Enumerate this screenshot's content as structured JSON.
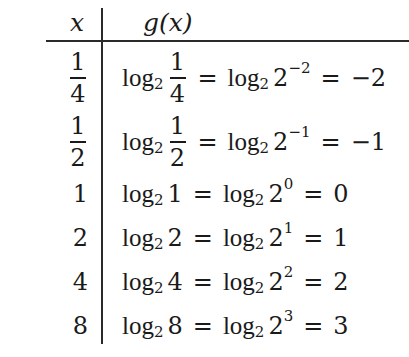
{
  "table": {
    "headers": {
      "x": "x",
      "g": "g(x)"
    },
    "rows": [
      {
        "x_num": "1",
        "x_den": "4",
        "x": "1/4",
        "arg_num": "1",
        "arg_den": "4",
        "base": "2",
        "exp": "−2",
        "result": "−2",
        "log": "log",
        "sub": "2",
        "eq": "="
      },
      {
        "x_num": "1",
        "x_den": "2",
        "x": "1/2",
        "arg_num": "1",
        "arg_den": "2",
        "base": "2",
        "exp": "−1",
        "result": "−1",
        "log": "log",
        "sub": "2",
        "eq": "="
      },
      {
        "x": "1",
        "arg": "1",
        "base": "2",
        "exp": "0",
        "result": "0",
        "log": "log",
        "sub": "2",
        "eq": "="
      },
      {
        "x": "2",
        "arg": "2",
        "base": "2",
        "exp": "1",
        "result": "1",
        "log": "log",
        "sub": "2",
        "eq": "="
      },
      {
        "x": "4",
        "arg": "4",
        "base": "2",
        "exp": "2",
        "result": "2",
        "log": "log",
        "sub": "2",
        "eq": "="
      },
      {
        "x": "8",
        "arg": "8",
        "base": "2",
        "exp": "3",
        "result": "3",
        "log": "log",
        "sub": "2",
        "eq": "="
      }
    ]
  }
}
